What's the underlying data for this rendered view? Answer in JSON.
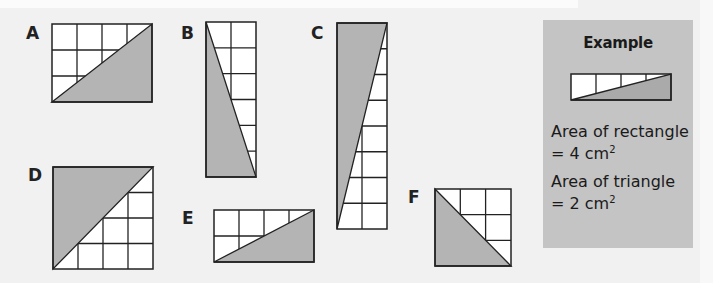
{
  "colors": {
    "background": "#f1f1f1",
    "panel": "#c4c4c4",
    "shade": "#b4b4b4",
    "grid_line": "#222222",
    "cell_fill": "#ffffff"
  },
  "shapes": [
    {
      "id": "A",
      "label": "A",
      "cols": 4,
      "rows": 3,
      "diagonal": "bottom-left to top-right",
      "shaded": "lower-right"
    },
    {
      "id": "B",
      "label": "B",
      "cols": 2,
      "rows": 6,
      "diagonal": "top-left to bottom-right",
      "shaded": "lower-left"
    },
    {
      "id": "C",
      "label": "C",
      "cols": 2,
      "rows": 8,
      "diagonal": "bottom-left to top-right",
      "shaded": "upper-left"
    },
    {
      "id": "D",
      "label": "D",
      "cols": 4,
      "rows": 4,
      "diagonal": "bottom-left to top-right",
      "shaded": "upper-left"
    },
    {
      "id": "E",
      "label": "E",
      "cols": 4,
      "rows": 2,
      "diagonal": "bottom-left to top-right",
      "shaded": "lower-right"
    },
    {
      "id": "F",
      "label": "F",
      "cols": 3,
      "rows": 3,
      "diagonal": "top-left to bottom-right",
      "shaded": "lower-left"
    }
  ],
  "example": {
    "title": "Example",
    "shape": {
      "cols": 4,
      "rows": 1,
      "diagonal": "bottom-left to top-right",
      "shaded": "lower-right"
    },
    "rect_area_label": "Area of rectangle",
    "rect_area_value": "= 4 cm",
    "rect_area_unit_exp": "2",
    "tri_area_label": "Area of triangle",
    "tri_area_value": "= 2 cm",
    "tri_area_unit_exp": "2"
  }
}
